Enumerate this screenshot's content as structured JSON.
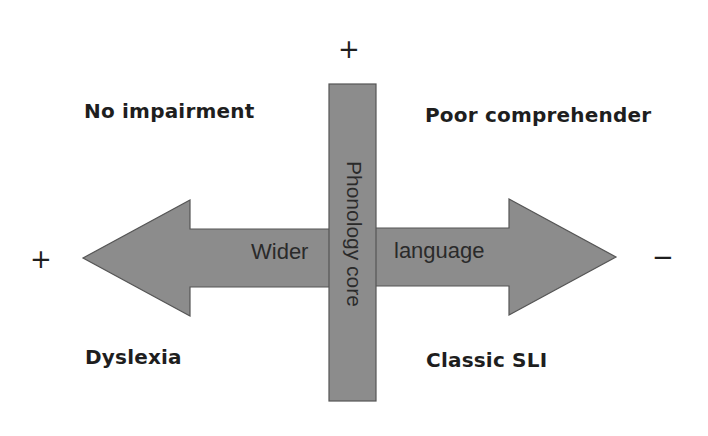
{
  "diagram": {
    "colors": {
      "shape_fill": "#8c8c8c",
      "shape_stroke": "#555555",
      "text": "#1e1e1e",
      "background": "#ffffff"
    },
    "axes": {
      "vertical": {
        "label": "Phonology core",
        "top_sign": "+"
      },
      "horizontal": {
        "left_label": "Wider",
        "right_label": "language",
        "left_sign": "+",
        "right_sign": "−"
      }
    },
    "quadrants": {
      "top_left": "No impairment",
      "top_right": "Poor comprehender",
      "bottom_left": "Dyslexia",
      "bottom_right": "Classic SLI"
    }
  }
}
